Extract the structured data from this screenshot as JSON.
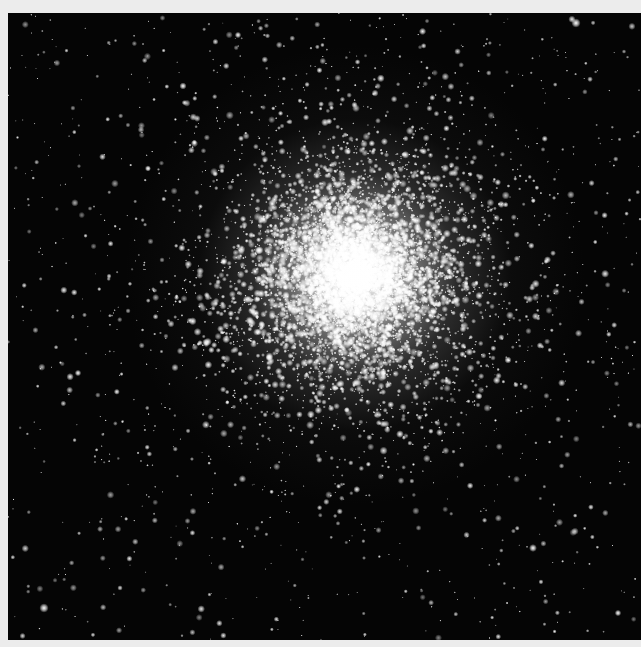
{
  "image": {
    "subject": "globular star cluster",
    "description": "Grayscale astronomical photograph of a dense globular cluster with a bright, saturated core fading into scattered field stars against a black sky",
    "frame": {
      "border_color": "#ececec",
      "sky_color": "#050505",
      "photo_left": 8,
      "photo_top": 13,
      "photo_width": 633,
      "photo_height": 627
    },
    "cluster": {
      "center_x": 347,
      "center_y": 262,
      "core_radius": 60,
      "halo_radius": 230,
      "core_color": "#f4f4f4",
      "star_color": "#ffffff"
    },
    "stars": {
      "cluster_count": 9000,
      "field_count": 1100,
      "bright_field_stars": [
        {
          "x": 36,
          "y": 595,
          "r": 2.6
        },
        {
          "x": 568,
          "y": 10,
          "r": 2.6
        },
        {
          "x": 175,
          "y": 73,
          "r": 2.0
        },
        {
          "x": 525,
          "y": 535,
          "r": 2.2
        },
        {
          "x": 500,
          "y": 347,
          "r": 2.0
        },
        {
          "x": 70,
          "y": 360,
          "r": 1.8
        },
        {
          "x": 610,
          "y": 600,
          "r": 1.8
        },
        {
          "x": 230,
          "y": 22,
          "r": 1.8
        }
      ],
      "seed": 42
    }
  }
}
